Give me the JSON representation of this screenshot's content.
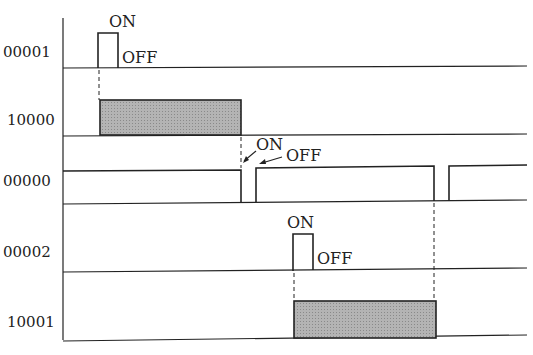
{
  "diagram": {
    "type": "timing-diagram",
    "signals": [
      {
        "label": "00001",
        "kind": "pulse",
        "on_label": "ON",
        "off_label": "OFF"
      },
      {
        "label": "10000",
        "kind": "shaded-output"
      },
      {
        "label": "00000",
        "kind": "normally-on-with-dips",
        "on_label": "ON",
        "off_label": "OFF"
      },
      {
        "label": "00002",
        "kind": "pulse",
        "on_label": "ON",
        "off_label": "OFF"
      },
      {
        "label": "10001",
        "kind": "shaded-output"
      }
    ],
    "colors": {
      "line": "#222222",
      "fill": "#a8a8a8",
      "background": "#ffffff"
    }
  }
}
